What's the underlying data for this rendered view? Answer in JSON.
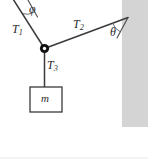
{
  "figure": {
    "type": "free-body-diagram",
    "background_color": "#ffffff",
    "line_color": "#3a3a3a",
    "wall": {
      "name": "wall-hatching-block",
      "color": "#d4d4d4",
      "x": 122,
      "y": 0,
      "width": 26,
      "height": 127
    },
    "baseline": {
      "name": "bottom-rule",
      "color": "#e6e6e6",
      "y": 158
    },
    "knot": {
      "name": "knot-joint",
      "cx": 44.5,
      "cy": 48.5,
      "outer_r": 4.6,
      "inner_r": 1.7,
      "fill": "#111111",
      "inner_fill": "#ffffff"
    },
    "cords": [
      {
        "id": "T1",
        "label": "T",
        "subscript": "1",
        "x1": 14,
        "y1": 0,
        "x2": 44.5,
        "y2": 48.5
      },
      {
        "id": "T2",
        "label": "T",
        "subscript": "2",
        "x1": 44.5,
        "y1": 48.5,
        "x2": 127,
        "y2": 18
      },
      {
        "id": "T3",
        "label": "T",
        "subscript": "3",
        "x1": 44.5,
        "y1": 48.5,
        "x2": 44.5,
        "y2": 87
      }
    ],
    "support_line": {
      "name": "ceiling-support-line",
      "x1": 28,
      "y1": 0,
      "x2": 36,
      "y2": 16
    },
    "wall_line": {
      "name": "wall-reference-line",
      "x1": 127,
      "y1": 18,
      "x2": 118,
      "y2": 38
    },
    "angles": [
      {
        "id": "phi",
        "symbol": "φ",
        "name": "angle-phi",
        "vertex_x": 24,
        "vertex_y": 3
      },
      {
        "id": "theta",
        "symbol": "θ",
        "name": "angle-theta",
        "vertex_x": 127,
        "vertex_y": 18
      }
    ],
    "mass_box": {
      "name": "mass-block",
      "label": "m",
      "x": 30,
      "y": 87,
      "width": 32,
      "height": 25,
      "stroke": "#3a3a3a",
      "fill": "#ffffff"
    }
  }
}
